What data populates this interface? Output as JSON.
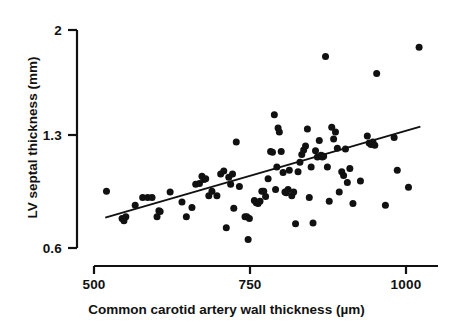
{
  "chart_data": {
    "type": "scatter",
    "title": "",
    "xlabel": "Common carotid artery wall thickness (µm)",
    "ylabel": "LV septal thickness (mm)",
    "xlim": [
      500,
      1035
    ],
    "ylim": [
      0.6,
      2.0
    ],
    "xticks": [
      500,
      750,
      1000
    ],
    "xticklabels": [
      "500",
      "750",
      "1000"
    ],
    "yticks": [
      0.6,
      1.3,
      2.0
    ],
    "yticklabels": [
      "0.6",
      "1.3",
      "2"
    ],
    "grid": false,
    "legend": false,
    "marker_color": "#111111",
    "marker_size_px": 7,
    "line_color": "#111111",
    "axis_color": "#111111",
    "trendline": {
      "type": "line",
      "label": "regression line",
      "x": [
        518,
        1023
      ],
      "y": [
        0.795,
        1.38
      ]
    },
    "points": [
      [
        520,
        0.965
      ],
      [
        545,
        0.79
      ],
      [
        548,
        0.775
      ],
      [
        551,
        0.8
      ],
      [
        566,
        0.875
      ],
      [
        578,
        0.925
      ],
      [
        586,
        0.925
      ],
      [
        593,
        0.925
      ],
      [
        601,
        0.8
      ],
      [
        604,
        0.84
      ],
      [
        606,
        0.835
      ],
      [
        622,
        0.96
      ],
      [
        641,
        0.895
      ],
      [
        648,
        0.8
      ],
      [
        657,
        0.86
      ],
      [
        663,
        1.01
      ],
      [
        669,
        1.015
      ],
      [
        673,
        1.06
      ],
      [
        676,
        1.04
      ],
      [
        679,
        1.045
      ],
      [
        684,
        0.935
      ],
      [
        689,
        0.965
      ],
      [
        697,
        0.935
      ],
      [
        703,
        1.075
      ],
      [
        708,
        1.095
      ],
      [
        712,
        0.73
      ],
      [
        716,
        1.055
      ],
      [
        719,
        1.01
      ],
      [
        722,
        1.075
      ],
      [
        724,
        0.855
      ],
      [
        728,
        1.28
      ],
      [
        733,
        0.995
      ],
      [
        742,
        0.8
      ],
      [
        745,
        0.8
      ],
      [
        747,
        0.655
      ],
      [
        749,
        0.79
      ],
      [
        757,
        0.905
      ],
      [
        760,
        0.89
      ],
      [
        763,
        0.885
      ],
      [
        766,
        0.9
      ],
      [
        769,
        0.965
      ],
      [
        772,
        0.965
      ],
      [
        775,
        0.93
      ],
      [
        779,
        1.045
      ],
      [
        783,
        1.22
      ],
      [
        786,
        1.215
      ],
      [
        789,
        1.455
      ],
      [
        791,
        0.975
      ],
      [
        793,
        1.12
      ],
      [
        795,
        1.37
      ],
      [
        797,
        1.345
      ],
      [
        800,
        1.22
      ],
      [
        803,
        1.085
      ],
      [
        806,
        0.96
      ],
      [
        808,
        0.955
      ],
      [
        811,
        0.975
      ],
      [
        813,
        1.1
      ],
      [
        817,
        0.935
      ],
      [
        820,
        0.96
      ],
      [
        823,
        0.755
      ],
      [
        827,
        1.09
      ],
      [
        830,
        1.15
      ],
      [
        833,
        1.2
      ],
      [
        836,
        1.23
      ],
      [
        839,
        1.255
      ],
      [
        842,
        1.365
      ],
      [
        845,
        0.925
      ],
      [
        848,
        1.12
      ],
      [
        851,
        0.76
      ],
      [
        855,
        1.225
      ],
      [
        858,
        1.185
      ],
      [
        861,
        1.29
      ],
      [
        864,
        1.195
      ],
      [
        866,
        1.185
      ],
      [
        868,
        1.19
      ],
      [
        871,
        1.83
      ],
      [
        874,
        1.12
      ],
      [
        877,
        0.9
      ],
      [
        881,
        1.375
      ],
      [
        884,
        1.3
      ],
      [
        887,
        1.345
      ],
      [
        890,
        1.24
      ],
      [
        893,
        0.96
      ],
      [
        897,
        1.09
      ],
      [
        900,
        1.065
      ],
      [
        903,
        1.235
      ],
      [
        906,
        1.02
      ],
      [
        910,
        1.11
      ],
      [
        915,
        0.885
      ],
      [
        927,
        1.03
      ],
      [
        938,
        1.32
      ],
      [
        941,
        1.275
      ],
      [
        944,
        1.265
      ],
      [
        947,
        1.28
      ],
      [
        950,
        1.26
      ],
      [
        953,
        1.72
      ],
      [
        967,
        0.875
      ],
      [
        981,
        1.31
      ],
      [
        986,
        1.1
      ],
      [
        1004,
        0.99
      ],
      [
        1021,
        1.89
      ]
    ]
  }
}
